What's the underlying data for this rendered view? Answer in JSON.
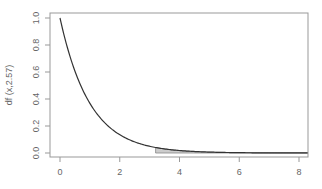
{
  "chart_data": {
    "type": "area",
    "title": "",
    "xlabel": "",
    "ylabel": "df (x,2.57)",
    "xlim": [
      -0.3,
      8.3
    ],
    "ylim": [
      -0.03,
      1.03
    ],
    "grid": false,
    "legend": null,
    "x_ticks": [
      0,
      2,
      4,
      6,
      8
    ],
    "x_tick_labels": [
      "0",
      "2",
      "4",
      "6",
      "8"
    ],
    "y_ticks": [
      0.0,
      0.2,
      0.4,
      0.6,
      0.8,
      1.0
    ],
    "y_tick_labels": [
      "0.0",
      "0.2",
      "0.4",
      "0.6",
      "0.8",
      "1.0"
    ],
    "series": [
      {
        "name": "density curve",
        "x": [
          0,
          0.5,
          1,
          1.5,
          2,
          2.5,
          3,
          3.5,
          4,
          5,
          6,
          7,
          8
        ],
        "y": [
          1.0,
          0.61,
          0.37,
          0.22,
          0.14,
          0.08,
          0.05,
          0.03,
          0.02,
          0.007,
          0.002,
          0.001,
          0.0003
        ]
      }
    ],
    "shaded_region": {
      "from_x": 3.2,
      "to_x": 8.3,
      "description": "tail area under curve"
    },
    "colors": {
      "line": "#333333",
      "shade": "#cccccc",
      "axis": "#888888"
    }
  }
}
